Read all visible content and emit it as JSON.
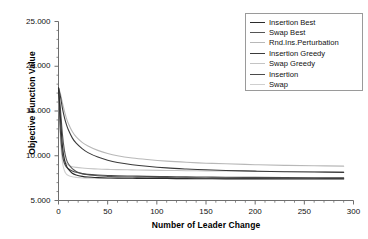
{
  "chart_data": {
    "type": "line",
    "title": "",
    "xlabel": "Number of Leader Change",
    "ylabel": "Objective Function Value",
    "xlim": [
      0,
      300
    ],
    "ylim": [
      5.0,
      25.0
    ],
    "xticks": [
      "0",
      "50",
      "100",
      "150",
      "200",
      "250",
      "300"
    ],
    "xtick_values": [
      0,
      50,
      100,
      150,
      200,
      250,
      300
    ],
    "yticks": [
      "5.000",
      "10.000",
      "15.000",
      "20.000",
      "25.000"
    ],
    "ytick_values": [
      5.0,
      10.0,
      15.0,
      20.0,
      25.0
    ],
    "grid": false,
    "minor_ticks": true,
    "legend_position": "top-right",
    "x": [
      0,
      2,
      4,
      6,
      8,
      10,
      14,
      18,
      24,
      30,
      40,
      50,
      60,
      75,
      90,
      110,
      130,
      150,
      170,
      200,
      230,
      260,
      290
    ],
    "series": [
      {
        "name": "Insertion Best",
        "color": "#2b2b2b",
        "values": [
          17.6,
          14.2,
          11.1,
          9.6,
          8.9,
          8.5,
          8.05,
          7.85,
          7.7,
          7.62,
          7.56,
          7.52,
          7.5,
          7.48,
          7.46,
          7.45,
          7.44,
          7.43,
          7.42,
          7.42,
          7.41,
          7.41,
          7.4
        ]
      },
      {
        "name": "Swap Best",
        "color": "#555555",
        "values": [
          17.6,
          15.2,
          12.4,
          10.6,
          9.6,
          9.1,
          8.55,
          8.25,
          8.0,
          7.88,
          7.76,
          7.7,
          7.66,
          7.62,
          7.59,
          7.56,
          7.54,
          7.52,
          7.51,
          7.5,
          7.49,
          7.48,
          7.47
        ]
      },
      {
        "name": "Rnd.Ins.Perturbation",
        "color": "#b8b8b8",
        "values": [
          17.6,
          16.9,
          15.9,
          15.0,
          14.2,
          13.6,
          12.7,
          12.1,
          11.5,
          11.1,
          10.6,
          10.25,
          10.0,
          9.75,
          9.58,
          9.4,
          9.27,
          9.17,
          9.1,
          9.0,
          8.93,
          8.88,
          8.84
        ]
      },
      {
        "name": "Insertion Greedy",
        "color": "#3a3a3a",
        "values": [
          17.6,
          16.6,
          15.3,
          14.3,
          13.5,
          12.9,
          12.0,
          11.4,
          10.8,
          10.35,
          9.85,
          9.5,
          9.25,
          9.0,
          8.82,
          8.64,
          8.52,
          8.43,
          8.36,
          8.28,
          8.22,
          8.18,
          8.14
        ]
      },
      {
        "name": "Swap Greedy",
        "color": "#c4c4c4",
        "values": [
          17.6,
          13.3,
          10.6,
          9.6,
          9.15,
          8.95,
          8.78,
          8.7,
          8.63,
          8.58,
          8.52,
          8.48,
          8.45,
          8.42,
          8.39,
          8.36,
          8.33,
          8.31,
          8.29,
          8.26,
          8.24,
          8.22,
          8.2
        ]
      },
      {
        "name": "Insertion",
        "color": "#4a4a4a",
        "values": [
          17.6,
          12.6,
          10.1,
          9.15,
          8.75,
          8.55,
          8.3,
          8.15,
          8.0,
          7.92,
          7.85,
          7.8,
          7.77,
          7.73,
          7.7,
          7.67,
          7.64,
          7.62,
          7.6,
          7.58,
          7.56,
          7.55,
          7.54
        ]
      },
      {
        "name": "Swap",
        "color": "#cfcfcf",
        "values": [
          17.6,
          11.8,
          9.3,
          8.35,
          7.95,
          7.8,
          7.65,
          7.58,
          7.52,
          7.5,
          7.48,
          7.47,
          7.46,
          7.46,
          7.45,
          7.45,
          7.44,
          7.44,
          7.44,
          7.43,
          7.43,
          7.43,
          7.43
        ]
      }
    ]
  },
  "axis": {
    "x_title": "Number of Leader Change",
    "y_title": "Objective Function Value"
  },
  "legend": {
    "items": [
      {
        "label": "Insertion Best",
        "color": "#2b2b2b"
      },
      {
        "label": "Swap Best",
        "color": "#555555"
      },
      {
        "label": "Rnd.Ins.Perturbation",
        "color": "#b8b8b8"
      },
      {
        "label": "Insertion Greedy",
        "color": "#3a3a3a"
      },
      {
        "label": "Swap Greedy",
        "color": "#c4c4c4"
      },
      {
        "label": "Insertion",
        "color": "#4a4a4a"
      },
      {
        "label": "Swap",
        "color": "#cfcfcf"
      }
    ]
  },
  "colors": {
    "axis": "#6e6e6e",
    "text": "#111111",
    "background": "#ffffff",
    "legend_border": "#9a9a9a"
  }
}
